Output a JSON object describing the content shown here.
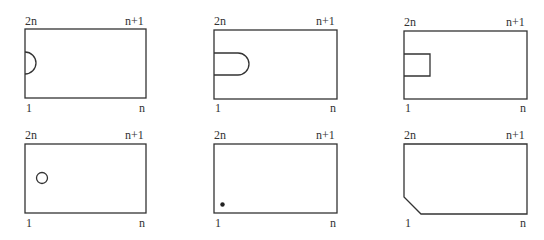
{
  "diagram": {
    "stroke_color": "#333333",
    "panels": [
      {
        "id": "panel-1",
        "feature": "semicircle notch on left edge",
        "labels": {
          "top_left": "2n",
          "top_right": "n+1",
          "bottom_left": "1",
          "bottom_right": "n"
        }
      },
      {
        "id": "panel-2",
        "feature": "U-shaped slot from left edge",
        "labels": {
          "top_left": "2n",
          "top_right": "n+1",
          "bottom_left": "1",
          "bottom_right": "n"
        }
      },
      {
        "id": "panel-3",
        "feature": "square notch on left edge",
        "labels": {
          "top_left": "2n",
          "top_right": "n+1",
          "bottom_left": "1",
          "bottom_right": "n"
        }
      },
      {
        "id": "panel-4",
        "feature": "small hollow circle inside",
        "labels": {
          "top_left": "2n",
          "top_right": "n+1",
          "bottom_left": "1",
          "bottom_right": "n"
        }
      },
      {
        "id": "panel-5",
        "feature": "small filled dot near bottom-left corner",
        "labels": {
          "top_left": "2n",
          "top_right": "n+1",
          "bottom_left": "1",
          "bottom_right": "n"
        }
      },
      {
        "id": "panel-6",
        "feature": "chamfered bottom-left corner",
        "labels": {
          "top_left": "2n",
          "top_right": "n+1",
          "bottom_left": "1",
          "bottom_right": "n"
        }
      }
    ]
  }
}
